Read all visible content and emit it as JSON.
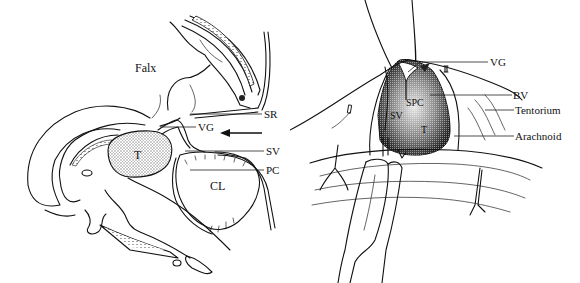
{
  "figure": {
    "left_panel": {
      "title": "Sagittal view",
      "labels": {
        "falx": "Falx",
        "sr": "SR",
        "vg": "VG",
        "sv": "SV",
        "pc": "PC",
        "t": "T",
        "cl": "CL"
      },
      "arrow": "approach-direction-arrow"
    },
    "right_panel": {
      "title": "Operative view",
      "labels": {
        "vg": "VG",
        "bv": "BV",
        "tentorium": "Tentorium",
        "arachnoid": "Arachnoid",
        "spc": "SPC",
        "sv": "SV",
        "t": "T"
      }
    },
    "colors": {
      "ink": "#111111",
      "background": "#ffffff",
      "tumor_stipple": "#9a9a9a"
    }
  }
}
